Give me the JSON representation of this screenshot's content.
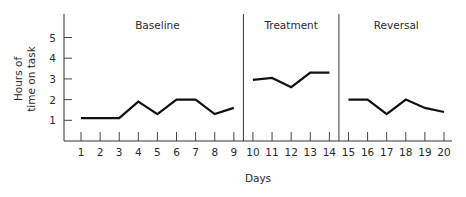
{
  "chart_data": {
    "type": "line",
    "title": "",
    "xlabel": "Days",
    "ylabel": "Hours of time on task",
    "ylabel_lines": [
      "Hours of",
      "time on task"
    ],
    "ylim": [
      0,
      6
    ],
    "yticks": [
      1,
      2,
      3,
      4,
      5
    ],
    "x": [
      1,
      2,
      3,
      4,
      5,
      6,
      7,
      8,
      9,
      10,
      11,
      12,
      13,
      14,
      15,
      16,
      17,
      18,
      19,
      20
    ],
    "grid": false,
    "legend": null,
    "phases": [
      {
        "name": "Baseline",
        "days": [
          1,
          2,
          3,
          4,
          5,
          6,
          7,
          8,
          9
        ],
        "values": [
          1.1,
          1.1,
          1.1,
          1.9,
          1.3,
          2.0,
          2.0,
          1.3,
          1.6
        ]
      },
      {
        "name": "Treatment",
        "days": [
          10,
          11,
          12,
          13,
          14
        ],
        "values": [
          2.95,
          3.05,
          2.6,
          3.3,
          3.3
        ]
      },
      {
        "name": "Reversal",
        "days": [
          15,
          16,
          17,
          18,
          19,
          20
        ],
        "values": [
          2.0,
          2.0,
          1.3,
          2.0,
          1.6,
          1.4
        ]
      }
    ],
    "series": [
      {
        "name": "Hours on task",
        "values": [
          1.1,
          1.1,
          1.1,
          1.9,
          1.3,
          2.0,
          2.0,
          1.3,
          1.6,
          2.95,
          3.05,
          2.6,
          3.3,
          3.3,
          2.0,
          2.0,
          1.3,
          2.0,
          1.6,
          1.4
        ]
      }
    ],
    "phase_dividers_between_days": [
      [
        9,
        10
      ],
      [
        14,
        15
      ]
    ]
  }
}
